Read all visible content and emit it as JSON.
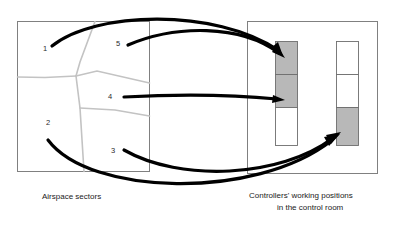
{
  "diagram": {
    "type": "mapping-diagram",
    "background_color": "#ffffff",
    "arrow_color": "#000000",
    "cell_active_color": "#b8b8b8",
    "cell_inactive_color": "#ffffff",
    "panel_border_color": "#808080",
    "sector_line_color": "#c3c3c3"
  },
  "left_panel": {
    "caption": "Airspace sectors",
    "sectors": [
      {
        "label": "1",
        "x": 45,
        "y": 49
      },
      {
        "label": "2",
        "x": 48,
        "y": 123
      },
      {
        "label": "3",
        "x": 113,
        "y": 151
      },
      {
        "label": "4",
        "x": 110,
        "y": 97
      },
      {
        "label": "5",
        "x": 118,
        "y": 44
      }
    ]
  },
  "right_panel": {
    "caption_line1": "Controllers' working positions",
    "caption_line2": "in the control room",
    "positions": [
      {
        "name": "working-position-left",
        "cells": [
          {
            "index": "1",
            "state": "occupied",
            "fill": "#b8b8b8"
          },
          {
            "index": "2",
            "state": "occupied",
            "fill": "#b8b8b8"
          },
          {
            "index": "3",
            "state": "empty",
            "fill": "#ffffff"
          }
        ]
      },
      {
        "name": "working-position-right",
        "cells": [
          {
            "index": "1",
            "state": "empty",
            "fill": "#ffffff"
          },
          {
            "index": "2",
            "state": "empty",
            "fill": "#ffffff"
          },
          {
            "index": "3",
            "state": "occupied",
            "fill": "#b8b8b8"
          }
        ]
      }
    ]
  },
  "mappings": [
    {
      "name": "sector-1-to-position-left-cell-1",
      "from": "1",
      "to": "working-position-left cell 1"
    },
    {
      "name": "sector-5-to-position-left-cell-1",
      "from": "5",
      "to": "working-position-left cell 1"
    },
    {
      "name": "sector-4-to-position-left-cell-2",
      "from": "4",
      "to": "working-position-left cell 2"
    },
    {
      "name": "sector-3-to-position-right-cell-3",
      "from": "3",
      "to": "working-position-right cell 3"
    },
    {
      "name": "sector-2-to-position-right-cell-3",
      "from": "2",
      "to": "working-position-right cell 3"
    }
  ]
}
